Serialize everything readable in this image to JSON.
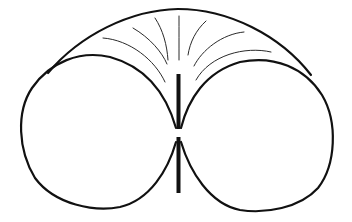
{
  "diagram": {
    "colors": {
      "background": "#ffffff",
      "stroke": "#111111",
      "field_lines": "#2a2a2a"
    },
    "elements": {
      "outer_envelope": "outer-envelope",
      "left_lobe": "left-lobe",
      "right_lobe": "right-lobe",
      "upper_dipole_element": "upper-dipole-element",
      "lower_dipole_element": "lower-dipole-element",
      "field_line_count": 7
    }
  }
}
